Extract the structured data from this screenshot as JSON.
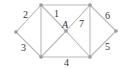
{
  "diagram": {
    "type": "graph",
    "nodes": [
      {
        "id": "L",
        "x": 16,
        "y": 32
      },
      {
        "id": "TL",
        "x": 41,
        "y": 5
      },
      {
        "id": "BL",
        "x": 41,
        "y": 57
      },
      {
        "id": "A",
        "x": 66,
        "y": 31
      },
      {
        "id": "TR",
        "x": 90,
        "y": 5
      },
      {
        "id": "BR",
        "x": 90,
        "y": 57
      },
      {
        "id": "R",
        "x": 116,
        "y": 31
      }
    ],
    "edges": [
      {
        "from": "L",
        "to": "TL"
      },
      {
        "from": "L",
        "to": "BL"
      },
      {
        "from": "TL",
        "to": "BL"
      },
      {
        "from": "TL",
        "to": "TR"
      },
      {
        "from": "BL",
        "to": "BR"
      },
      {
        "from": "TL",
        "to": "A"
      },
      {
        "from": "A",
        "to": "BR"
      },
      {
        "from": "BL",
        "to": "A"
      },
      {
        "from": "A",
        "to": "TR"
      },
      {
        "from": "TR",
        "to": "BR"
      },
      {
        "from": "TR",
        "to": "R"
      },
      {
        "from": "BR",
        "to": "R"
      }
    ],
    "labels": {
      "l2": "2",
      "l1": "1",
      "lA": "A",
      "l7": "7",
      "l6": "6",
      "l3": "3",
      "l4": "4",
      "l5": "5"
    }
  }
}
